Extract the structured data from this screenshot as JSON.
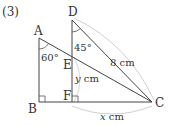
{
  "problem": {
    "number": "(3)"
  },
  "points": {
    "A": {
      "label": "A",
      "x": 39,
      "y": 38
    },
    "B": {
      "label": "B",
      "x": 39,
      "y": 102
    },
    "C": {
      "label": "C",
      "x": 152,
      "y": 102
    },
    "D": {
      "label": "D",
      "x": 72,
      "y": 20
    },
    "E": {
      "label": "E",
      "x": 72,
      "y": 57
    },
    "F": {
      "label": "F",
      "x": 72,
      "y": 102
    }
  },
  "angles": {
    "A": {
      "label": "60°"
    },
    "D": {
      "label": "45°"
    }
  },
  "measures": {
    "DC": {
      "value": "8",
      "unit": "cm"
    },
    "EF": {
      "var": "y",
      "unit": "cm"
    },
    "FC": {
      "var": "x",
      "unit": "cm"
    }
  },
  "colors": {
    "stroke": "#444444",
    "brace": "#c8c8c8"
  }
}
